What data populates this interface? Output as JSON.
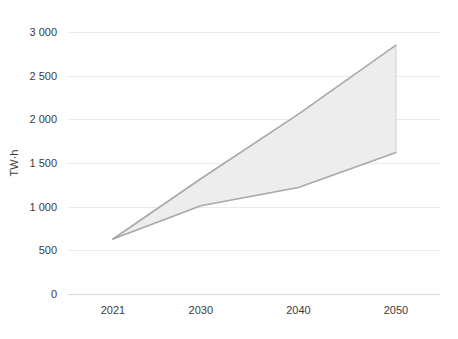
{
  "chart_data": {
    "type": "area",
    "title": "",
    "subtitle": "",
    "xlabel": "",
    "ylabel": "TW·h",
    "x": [
      2021,
      2030,
      2040,
      2050
    ],
    "xtick_labels": [
      "2021",
      "2030",
      "2040",
      "2050"
    ],
    "xlim": [
      2021,
      2050
    ],
    "ylim": [
      0,
      3000
    ],
    "ytick_values": [
      0,
      500,
      1000,
      1500,
      2000,
      2500,
      3000
    ],
    "ytick_labels": [
      "0",
      "500",
      "1 000",
      "1 500",
      "2 000",
      "2 500",
      "3 000"
    ],
    "grid": true,
    "legend": "none",
    "series": [
      {
        "name": "High scenario",
        "role": "upper-bound",
        "values": [
          630,
          1320,
          2060,
          2850
        ]
      },
      {
        "name": "Low scenario",
        "role": "lower-bound",
        "values": [
          630,
          1010,
          1220,
          1620
        ]
      }
    ],
    "band": {
      "name": "Projection range",
      "fill_color": "#ededed",
      "line_color": "#a8a8a8"
    },
    "annotations": []
  },
  "style": {
    "background": "#ffffff",
    "grid_color": "#ebebeb",
    "axis_color": "#d9d9d9",
    "text_color": "#3c3c3c"
  }
}
